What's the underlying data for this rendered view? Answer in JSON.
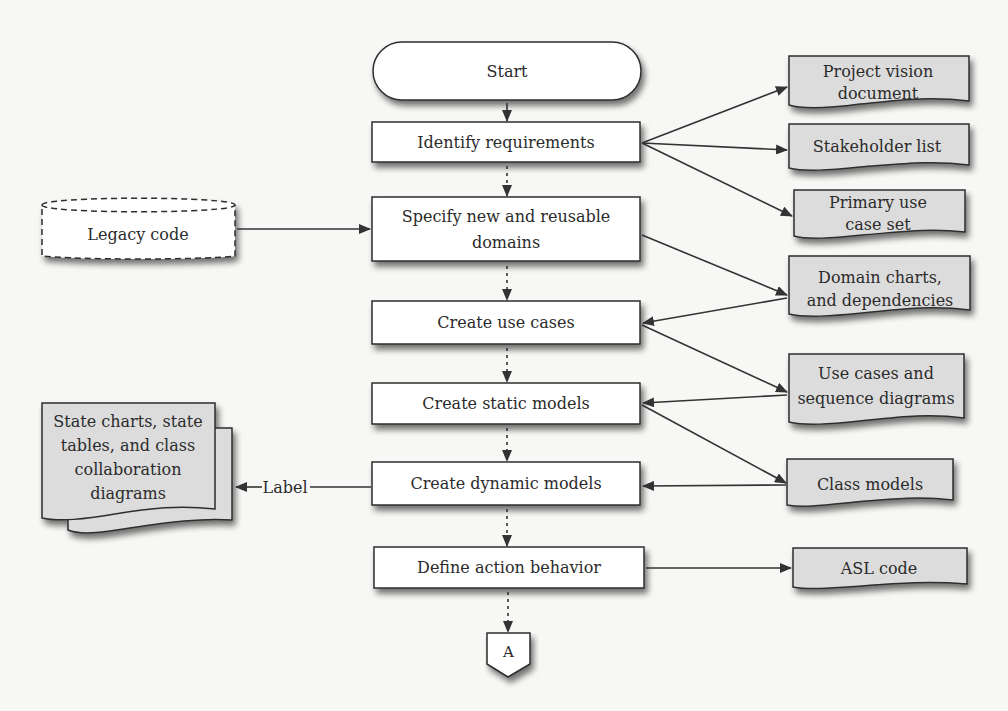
{
  "diagram": {
    "type": "flowchart",
    "process_steps": [
      {
        "id": "start",
        "label": "Start",
        "shape": "terminator"
      },
      {
        "id": "identify",
        "label": "Identify requirements",
        "shape": "process"
      },
      {
        "id": "specify",
        "lines": [
          "Specify new and reusable",
          "domains"
        ],
        "shape": "process"
      },
      {
        "id": "usecases",
        "label": "Create use cases",
        "shape": "process"
      },
      {
        "id": "static",
        "label": "Create static models",
        "shape": "process"
      },
      {
        "id": "dynamic",
        "label": "Create dynamic models",
        "shape": "process"
      },
      {
        "id": "action",
        "label": "Define action behavior",
        "shape": "process"
      },
      {
        "id": "connector",
        "label": "A",
        "shape": "off-page-connector"
      }
    ],
    "documents": [
      {
        "id": "vision",
        "lines": [
          "Project vision",
          "document"
        ]
      },
      {
        "id": "stakeholder",
        "lines": [
          "Stakeholder list"
        ]
      },
      {
        "id": "primary",
        "lines": [
          "Primary use",
          "case set"
        ]
      },
      {
        "id": "domaincharts",
        "lines": [
          "Domain charts,",
          "and dependencies"
        ]
      },
      {
        "id": "usecasedocs",
        "lines": [
          "Use cases and",
          "sequence diagrams"
        ]
      },
      {
        "id": "classmodels",
        "lines": [
          "Class models"
        ]
      },
      {
        "id": "asl",
        "lines": [
          "ASL code"
        ]
      }
    ],
    "legacy": {
      "label": "Legacy code",
      "shape": "dashed-storage"
    },
    "statecharts": {
      "lines": [
        "State charts, state",
        "tables, and class",
        "collaboration",
        "diagrams"
      ],
      "shape": "multi-document"
    },
    "edge_label": "Label",
    "edges": [
      {
        "from": "start",
        "to": "identify",
        "style": "solid"
      },
      {
        "from": "identify",
        "to": "specify",
        "style": "dotted"
      },
      {
        "from": "specify",
        "to": "usecases",
        "style": "dotted"
      },
      {
        "from": "usecases",
        "to": "static",
        "style": "dotted"
      },
      {
        "from": "static",
        "to": "dynamic",
        "style": "dotted"
      },
      {
        "from": "dynamic",
        "to": "action",
        "style": "dotted"
      },
      {
        "from": "action",
        "to": "connector",
        "style": "dotted"
      },
      {
        "from": "identify",
        "to": "vision"
      },
      {
        "from": "identify",
        "to": "stakeholder"
      },
      {
        "from": "identify",
        "to": "primary"
      },
      {
        "from": "legacy",
        "to": "specify"
      },
      {
        "from": "specify",
        "to": "domaincharts"
      },
      {
        "from": "domaincharts",
        "to": "usecases"
      },
      {
        "from": "usecases",
        "to": "usecasedocs"
      },
      {
        "from": "usecasedocs",
        "to": "static"
      },
      {
        "from": "static",
        "to": "classmodels"
      },
      {
        "from": "classmodels",
        "to": "dynamic"
      },
      {
        "from": "dynamic",
        "to": "statecharts",
        "label": "Label"
      },
      {
        "from": "action",
        "to": "asl"
      }
    ]
  },
  "colors": {
    "background": "#f7f7f5",
    "process_fill": "#ffffff",
    "document_fill": "#dcdcdc",
    "stroke": "#2e2e2e",
    "shadow": "#7a7a7a"
  }
}
